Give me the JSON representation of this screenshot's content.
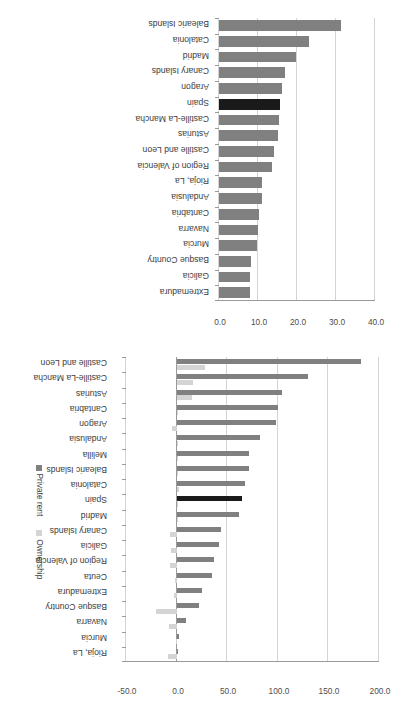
{
  "chart_data": [
    {
      "id": "top",
      "type": "bar",
      "title": "",
      "xlabel": "",
      "ylabel": "",
      "ylim": [
        0.0,
        40.0
      ],
      "yticks": [
        "0.0",
        "10.0",
        "20.0",
        "30.0",
        "40.0"
      ],
      "ytick_values": [
        0.0,
        10.0,
        20.0,
        30.0,
        40.0
      ],
      "grid": true,
      "legend": null,
      "highlight_category": "Spain",
      "highlight_color": "#1a1a1a",
      "series_color": "#808080",
      "categories": [
        "Balearic Islands",
        "Catalonia",
        "Madrid",
        "Canary Islands",
        "Aragon",
        "Spain",
        "Castille-La Mancha",
        "Asturias",
        "Castille and Leon",
        "Region of Valencia",
        "Rioja, La",
        "Andalusia",
        "Cantabria",
        "Navarra",
        "Murcia",
        "Basque Country",
        "Galicia",
        "Extremadura"
      ],
      "values": [
        31.3,
        23.0,
        19.7,
        17.0,
        16.1,
        15.6,
        15.5,
        15.1,
        14.1,
        13.6,
        10.9,
        10.9,
        10.2,
        10.1,
        9.7,
        8.1,
        8.0,
        7.9
      ]
    },
    {
      "id": "bottom",
      "type": "bar",
      "title": "",
      "xlabel": "",
      "ylabel": "",
      "ylim": [
        -50.0,
        200.0
      ],
      "yticks": [
        "-50.0",
        "0.0",
        "50.0",
        "100.0",
        "150.0",
        "200.0"
      ],
      "ytick_values": [
        -50.0,
        0.0,
        50.0,
        100.0,
        150.0,
        200.0
      ],
      "grid": true,
      "legend_position": "right",
      "highlight_category": "Spain",
      "highlight_color": "#1a1a1a",
      "series": [
        {
          "name": "Private rent",
          "color": "#808080",
          "values": [
            182.0,
            130.0,
            104.0,
            100.0,
            98.0,
            82.0,
            72.0,
            72.0,
            68.0,
            65.0,
            62.0,
            44.0,
            42.0,
            37.0,
            35.0,
            25.0,
            22.0,
            9.0,
            2.0,
            1.0
          ]
        },
        {
          "name": "Ownership",
          "color": "#d4d4d4",
          "values": [
            28.0,
            16.0,
            15.0,
            1.0,
            -5.0,
            1.0,
            1.0,
            1.0,
            2.0,
            1.0,
            1.0,
            -7.0,
            -6.0,
            -7.0,
            -2.0,
            -3.0,
            -20.0,
            -8.0,
            -1.0,
            -9.0
          ]
        }
      ],
      "categories": [
        "Castille and Leon",
        "Castille-La Mancha",
        "Asturias",
        "Cantabria",
        "Aragon",
        "Andalusia",
        "Melilla",
        "Balearic Islands",
        "Catalonia",
        "Spain",
        "Madrid",
        "Canary Islands",
        "Galicia",
        "Region of Valencia",
        "Ceuta",
        "Extremadura",
        "Basque Country",
        "Navarra",
        "Murcia",
        "Rioja, La"
      ]
    }
  ]
}
